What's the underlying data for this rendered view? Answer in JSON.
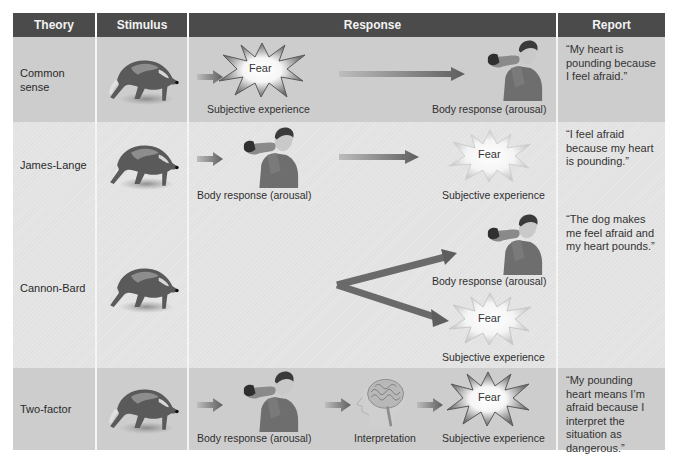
{
  "headers": {
    "theory": "Theory",
    "stimulus": "Stimulus",
    "response": "Response",
    "report": "Report"
  },
  "rows": [
    {
      "theory": "Common sense",
      "stimulus_icon": "running-dog",
      "response": [
        {
          "icon": "fear-starburst",
          "label": "Fear",
          "caption": "Subjective experience"
        },
        {
          "icon": "man-flinching",
          "caption": "Body response (arousal)"
        }
      ],
      "report": "“My heart is pounding because I feel afraid.”"
    },
    {
      "theory": "James-Lange",
      "stimulus_icon": "running-dog",
      "response": [
        {
          "icon": "man-flinching",
          "caption": "Body response (arousal)"
        },
        {
          "icon": "fear-starburst",
          "label": "Fear",
          "caption": "Subjective experience"
        }
      ],
      "report": "“I feel afraid because my heart is pounding.”"
    },
    {
      "theory": "Cannon-Bard",
      "stimulus_icon": "running-dog",
      "response": [
        {
          "icon": "man-flinching",
          "caption": "Body response (arousal)"
        },
        {
          "icon": "fear-starburst",
          "label": "Fear",
          "caption": "Subjective experience"
        }
      ],
      "report": "“The dog makes me feel afraid and my heart pounds.”"
    },
    {
      "theory": "Two-factor",
      "stimulus_icon": "running-dog",
      "response": [
        {
          "icon": "man-flinching",
          "caption": "Body response (arousal)"
        },
        {
          "icon": "brain-head",
          "caption": "Interpretation"
        },
        {
          "icon": "fear-starburst",
          "label": "Fear",
          "caption": "Subjective experience"
        }
      ],
      "report": "“My pounding heart means I’m afraid because I interpret the situation as dangerous.”"
    }
  ],
  "colors": {
    "header_bg": "#4b4b4b",
    "header_text": "#f2f2f2",
    "row_dark": "#cdcdcd",
    "row_light": "#e2e2e2",
    "arrow": "#6a6a6a"
  }
}
